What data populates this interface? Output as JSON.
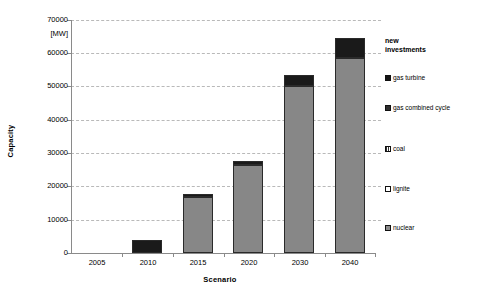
{
  "chart_data": {
    "type": "bar",
    "title": "",
    "xlabel": "Scenario",
    "ylabel": "Capacity",
    "unit": "[MW]",
    "categories": [
      "2005",
      "2010",
      "2015",
      "2020",
      "2030",
      "2040"
    ],
    "ylim": [
      0,
      70000
    ],
    "ytick_labels": [
      "0",
      "10000",
      "20000",
      "30000",
      "40000",
      "50000",
      "60000",
      "70000"
    ],
    "ytick_values": [
      0,
      10000,
      20000,
      30000,
      40000,
      50000,
      60000,
      70000
    ],
    "grid": true,
    "stacked": true,
    "legend_position": "right",
    "legend_title": "new investments",
    "series": [
      {
        "name": "nuclear",
        "swatch": "gray",
        "values": [
          0,
          0,
          16700,
          26400,
          50200,
          58500
        ]
      },
      {
        "name": "lignite",
        "swatch": "white",
        "values": [
          0,
          0,
          0,
          0,
          0,
          0
        ]
      },
      {
        "name": "coal",
        "swatch": "hatch",
        "values": [
          0,
          0,
          0,
          0,
          0,
          0
        ]
      },
      {
        "name": "gas combined cycle",
        "swatch": "darkgray",
        "values": [
          0,
          0,
          0,
          0,
          0,
          0
        ]
      },
      {
        "name": "gas turbine",
        "swatch": "dark",
        "values": [
          0,
          4000,
          1100,
          1100,
          3400,
          6000
        ]
      }
    ],
    "totals": [
      0,
      4000,
      17800,
      27500,
      53600,
      64500
    ]
  },
  "legend": {
    "title_line1": "new",
    "title_line2": "investments",
    "items": [
      {
        "label": "gas turbine",
        "swatch": "dark"
      },
      {
        "label": "gas combined cycle",
        "swatch": "darkgray"
      },
      {
        "label": "coal",
        "swatch": "hatch"
      },
      {
        "label": "lignite",
        "swatch": "white"
      },
      {
        "label": "nuclear",
        "swatch": "gray"
      }
    ]
  },
  "axes": {
    "y_title": "Capacity",
    "y_unit": "[MW]",
    "x_title": "Scenario",
    "y_ticks": [
      "70000",
      "60000",
      "50000",
      "40000",
      "30000",
      "20000",
      "10000",
      "0"
    ],
    "x_ticks": [
      "2005",
      "2010",
      "2015",
      "2020",
      "2030",
      "2040"
    ]
  },
  "colors": {
    "bar_dark": "#1a1a1a",
    "bar_gray": "#878787",
    "gridline": "#b9b9b9",
    "axis": "#8a8a8a",
    "text": "#000000",
    "background": "#ffffff"
  }
}
